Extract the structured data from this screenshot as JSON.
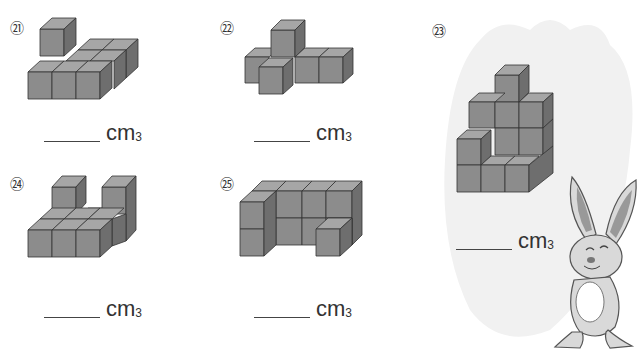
{
  "problems": [
    {
      "id": "21",
      "label": "㉑",
      "unit": "cm",
      "exponent": "3",
      "answer": ""
    },
    {
      "id": "22",
      "label": "㉒",
      "unit": "cm",
      "exponent": "3",
      "answer": ""
    },
    {
      "id": "23",
      "label": "㉓",
      "unit": "cm",
      "exponent": "3",
      "answer": ""
    },
    {
      "id": "24",
      "label": "㉔",
      "unit": "cm",
      "exponent": "3",
      "answer": ""
    },
    {
      "id": "25",
      "label": "㉕",
      "unit": "cm",
      "exponent": "3",
      "answer": ""
    }
  ],
  "colors": {
    "cube_front": "#8c8c8c",
    "cube_top": "#a6a6a6",
    "cube_side": "#6e6e6e",
    "carrot_bg": "#f0f0f0",
    "bunny_fill": "#d9d9d9"
  }
}
